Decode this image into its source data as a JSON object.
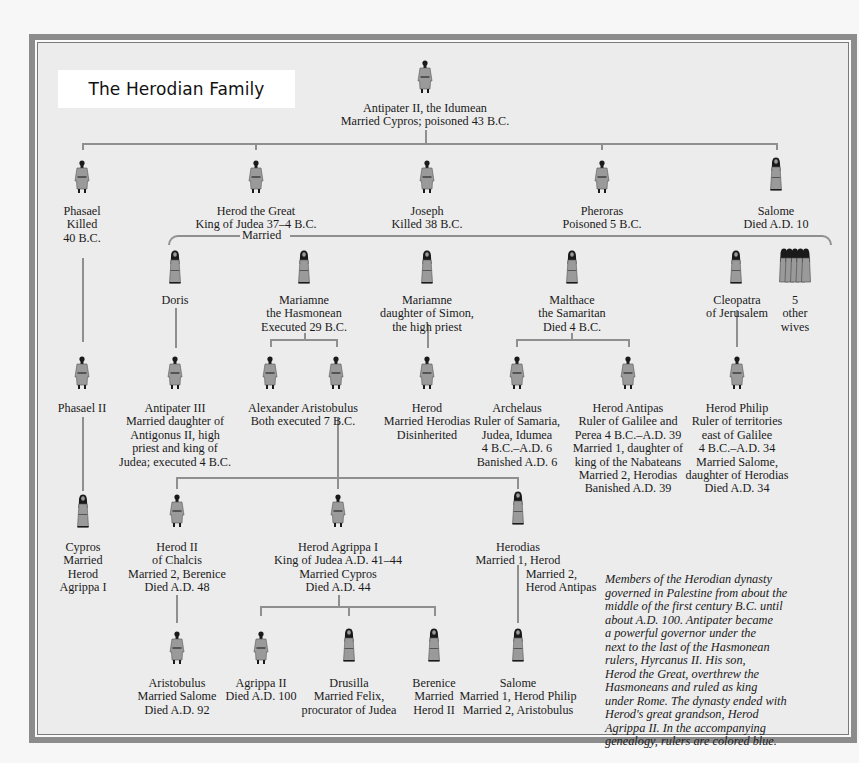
{
  "title": "The Herodian Family",
  "colors": {
    "frame_border": "#8c8c8c",
    "background": "#ececec",
    "connector": "#8f8f8f",
    "figure_robe": "#9a9a9a",
    "figure_dark": "#1a1a1a"
  },
  "icons": {
    "male": "male-figure-icon",
    "female": "female-figure-icon",
    "group": "group-of-wives-icon"
  },
  "married_label": "Married",
  "people": {
    "antipater_ii": {
      "lines": [
        "Antipater II, the Idumean",
        "Married Cypros; poisoned 43 B.C."
      ],
      "gender": "male"
    },
    "phasael": {
      "lines": [
        "Phasael",
        "Killed",
        "40 B.C."
      ],
      "gender": "male"
    },
    "herod_great": {
      "lines": [
        "Herod the Great",
        "King of Judea 37–4 B.C."
      ],
      "gender": "male"
    },
    "joseph": {
      "lines": [
        "Joseph",
        "Killed 38 B.C."
      ],
      "gender": "male"
    },
    "pheroras": {
      "lines": [
        "Pheroras",
        "Poisoned 5 B.C."
      ],
      "gender": "male"
    },
    "salome_sister": {
      "lines": [
        "Salome",
        "Died A.D. 10"
      ],
      "gender": "female"
    },
    "doris": {
      "lines": [
        "Doris"
      ],
      "gender": "female"
    },
    "mariamne_hasmonean": {
      "lines": [
        "Mariamne",
        "the Hasmonean",
        "Executed 29 B.C."
      ],
      "gender": "female"
    },
    "mariamne_simon": {
      "lines": [
        "Mariamne",
        "daughter of Simon,",
        "the high priest"
      ],
      "gender": "female"
    },
    "malthace": {
      "lines": [
        "Malthace",
        "the Samaritan",
        "Died 4 B.C."
      ],
      "gender": "female"
    },
    "cleopatra": {
      "lines": [
        "Cleopatra",
        "of Jerusalem"
      ],
      "gender": "female"
    },
    "other_wives": {
      "lines": [
        "5",
        "other",
        "wives"
      ],
      "gender": "group"
    },
    "phasael_ii": {
      "lines": [
        "Phasael II"
      ],
      "gender": "male"
    },
    "antipater_iii": {
      "lines": [
        "Antipater III",
        "Married daughter of",
        "Antigonus II, high",
        "priest and king of",
        "Judea; executed 4 B.C."
      ],
      "gender": "male"
    },
    "alexander_aristobulus": {
      "lines": [
        "Alexander Aristobulus",
        "Both executed 7 B.C."
      ],
      "gender": "male"
    },
    "herod_son": {
      "lines": [
        "Herod",
        "Married Herodias",
        "Disinherited"
      ],
      "gender": "male"
    },
    "archelaus": {
      "lines": [
        "Archelaus",
        "Ruler of Samaria,",
        "Judea, Idumea",
        "4 B.C.–A.D. 6",
        "Banished A.D. 6"
      ],
      "gender": "male"
    },
    "herod_antipas": {
      "lines": [
        "Herod Antipas",
        "Ruler of Galilee and",
        "Perea 4 B.C.–A.D. 39",
        "Married 1, daughter of",
        "king of the Nabateans",
        "Married 2, Herodias",
        "Banished A.D. 39"
      ],
      "gender": "male"
    },
    "herod_philip": {
      "lines": [
        "Herod Philip",
        "Ruler of territories",
        "east of Galilee",
        "4 B.C.–A.D. 34",
        "Married Salome,",
        "daughter of Herodias",
        "Died A.D. 34"
      ],
      "gender": "male"
    },
    "cypros": {
      "lines": [
        "Cypros",
        "Married",
        "Herod",
        "Agrippa I"
      ],
      "gender": "female"
    },
    "herod_ii_chalcis": {
      "lines": [
        "Herod II",
        "of Chalcis",
        "Married 2, Berenice",
        "Died A.D. 48"
      ],
      "gender": "male"
    },
    "herod_agrippa_i": {
      "lines": [
        "Herod Agrippa I",
        "King of Judea A.D. 41–44",
        "Married Cypros",
        "Died A.D. 44"
      ],
      "gender": "male"
    },
    "herodias": {
      "lines": [
        "Herodias",
        "Married 1, Herod"
      ],
      "gender": "female"
    },
    "herodias_married2": {
      "lines": [
        "Married 2,",
        "Herod Antipas"
      ]
    },
    "aristobulus": {
      "lines": [
        "Aristobulus",
        "Married Salome",
        "Died A.D. 92"
      ],
      "gender": "male"
    },
    "agrippa_ii": {
      "lines": [
        "Agrippa II",
        "Died A.D. 100"
      ],
      "gender": "male"
    },
    "drusilla": {
      "lines": [
        "Drusilla",
        "Married Felix,",
        "procurator of Judea"
      ],
      "gender": "female"
    },
    "berenice": {
      "lines": [
        "Berenice",
        "Married",
        "Herod II"
      ],
      "gender": "female"
    },
    "salome_daughter": {
      "lines": [
        "Salome",
        "Married 1, Herod Philip",
        "Married 2, Aristobulus"
      ],
      "gender": "female"
    }
  },
  "note": {
    "lines": [
      "Members of the Herodian dynasty",
      "governed in Palestine from about the",
      "middle of the first century B.C. until",
      "about A.D. 100. Antipater became",
      "a powerful governor under the",
      "next to the last of the Hasmonean",
      "rulers, Hyrcanus II. His son,",
      "Herod the Great, overthrew the",
      "Hasmoneans and ruled as king",
      "under Rome. The dynasty ended with",
      "Herod's great grandson, Herod",
      "Agrippa II. In the accompanying",
      "genealogy, rulers are colored blue."
    ]
  }
}
